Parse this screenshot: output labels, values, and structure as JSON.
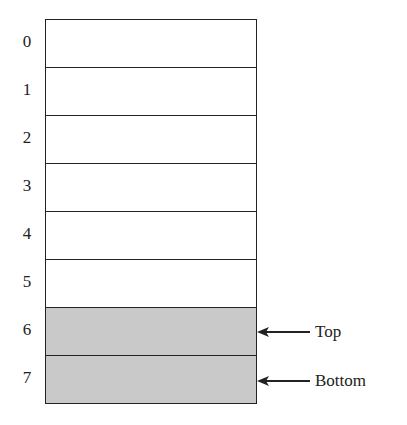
{
  "stack": {
    "cells": [
      {
        "index": "0",
        "filled": false
      },
      {
        "index": "1",
        "filled": false
      },
      {
        "index": "2",
        "filled": false
      },
      {
        "index": "3",
        "filled": false
      },
      {
        "index": "4",
        "filled": false
      },
      {
        "index": "5",
        "filled": false
      },
      {
        "index": "6",
        "filled": true
      },
      {
        "index": "7",
        "filled": true
      }
    ],
    "pointers": [
      {
        "label": "Top",
        "at_index": 6
      },
      {
        "label": "Bottom",
        "at_index": 7
      }
    ],
    "fill_color": "#c9c9c9"
  }
}
